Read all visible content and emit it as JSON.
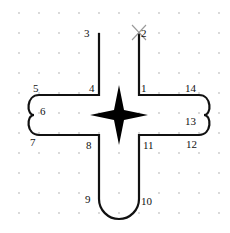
{
  "diagram": {
    "type": "path-puzzle",
    "colors": {
      "background": "#ffffff",
      "stroke": "#111111",
      "grid_dot": "#c8c8c8",
      "start_marker": "#9a9a9a",
      "star": "#000000"
    },
    "grid": {
      "spacing": 20,
      "origin_x": 19,
      "origin_y": 13,
      "cols": 11,
      "rows": 11
    },
    "points": [
      {
        "id": "1",
        "label": "1"
      },
      {
        "id": "2",
        "label": "2"
      },
      {
        "id": "3",
        "label": "3"
      },
      {
        "id": "4",
        "label": "4"
      },
      {
        "id": "5",
        "label": "5"
      },
      {
        "id": "6",
        "label": "6"
      },
      {
        "id": "7",
        "label": "7"
      },
      {
        "id": "8",
        "label": "8"
      },
      {
        "id": "9",
        "label": "9"
      },
      {
        "id": "10",
        "label": "10"
      },
      {
        "id": "11",
        "label": "11"
      },
      {
        "id": "12",
        "label": "12"
      },
      {
        "id": "13",
        "label": "13"
      },
      {
        "id": "14",
        "label": "14"
      }
    ],
    "start_marker": "x-marker",
    "center_symbol": "four-point-star"
  }
}
